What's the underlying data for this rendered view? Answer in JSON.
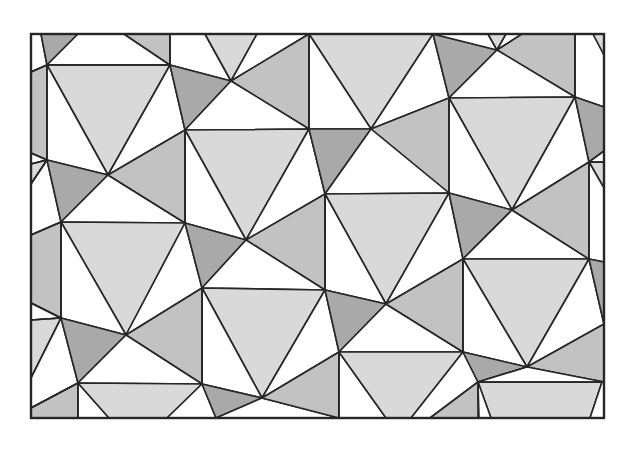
{
  "figure": {
    "title": "Periodic triangle-and-square tiling",
    "caption": "",
    "frame": {
      "x": 31,
      "y": 34,
      "width": 573,
      "height": 384
    },
    "colors": {
      "white": "#ffffff",
      "light": "#d9d9d9",
      "medium": "#c2c2c2",
      "dark": "#a9a9a9",
      "stroke": "#262626",
      "background": "#ffffff"
    },
    "polygons": [
      {
        "fill": "white",
        "points": "31,34 41,34 47,65 31,72"
      },
      {
        "fill": "dark",
        "points": "41,34 78,34 47,65"
      },
      {
        "fill": "white",
        "points": "78,34 124,34 170,65 47,65"
      },
      {
        "fill": "medium",
        "points": "124,34 170,34 170,65"
      },
      {
        "fill": "white",
        "points": "170,34 205,34 231,81 170,65"
      },
      {
        "fill": "light",
        "points": "205,34 257,34 231,81"
      },
      {
        "fill": "white",
        "points": "257,34 309,34 231,81"
      },
      {
        "fill": "medium",
        "points": "309,34 309,129 231,81"
      },
      {
        "fill": "light",
        "points": "309,34 433,34 371,129"
      },
      {
        "fill": "white",
        "points": "309,34 371,129 309,129"
      },
      {
        "fill": "white",
        "points": "433,34 449,98 371,129"
      },
      {
        "fill": "dark",
        "points": "433,34 497,50 449,98"
      },
      {
        "fill": "white",
        "points": "433,34 488,34 497,50"
      },
      {
        "fill": "light",
        "points": "488,34 506,34 497,50"
      },
      {
        "fill": "white",
        "points": "506,34 522,34 497,50"
      },
      {
        "fill": "medium",
        "points": "522,34 575,34 575,97 497,50"
      },
      {
        "fill": "white",
        "points": "497,50 575,97 449,98"
      },
      {
        "fill": "white",
        "points": "575,34 593,34 604,55 604,107 575,97"
      },
      {
        "fill": "light",
        "points": "593,34 604,34 604,55"
      },
      {
        "fill": "medium",
        "points": "31,72 47,65 47,160 31,153"
      },
      {
        "fill": "light",
        "points": "47,65 170,65 108,175"
      },
      {
        "fill": "white",
        "points": "47,65 108,175 47,160"
      },
      {
        "fill": "white",
        "points": "170,65 185,130 108,175"
      },
      {
        "fill": "dark",
        "points": "170,65 231,81 185,130"
      },
      {
        "fill": "white",
        "points": "231,81 309,129 185,130"
      },
      {
        "fill": "medium",
        "points": "449,98 449,193 371,129"
      },
      {
        "fill": "light",
        "points": "449,98 575,97 512,210"
      },
      {
        "fill": "white",
        "points": "449,98 512,210 449,193"
      },
      {
        "fill": "white",
        "points": "575,97 589,162 512,210"
      },
      {
        "fill": "dark",
        "points": "575,97 604,107 604,151 589,162"
      },
      {
        "fill": "white",
        "points": "31,153 47,160 31,164"
      },
      {
        "fill": "light",
        "points": "31,164 47,160 31,184"
      },
      {
        "fill": "white",
        "points": "31,184 47,160 61,222 31,235"
      },
      {
        "fill": "dark",
        "points": "47,160 108,175 61,222"
      },
      {
        "fill": "white",
        "points": "108,175 185,223 61,222"
      },
      {
        "fill": "light",
        "points": "185,130 309,129 246,240"
      },
      {
        "fill": "white",
        "points": "185,130 246,240 185,223"
      },
      {
        "fill": "medium",
        "points": "108,175 185,130 185,223"
      },
      {
        "fill": "white",
        "points": "309,129 325,194 246,240"
      },
      {
        "fill": "dark",
        "points": "309,129 371,129 325,194"
      },
      {
        "fill": "white",
        "points": "371,129 449,193 325,194"
      },
      {
        "fill": "light",
        "points": "325,194 449,193 386,304"
      },
      {
        "fill": "white",
        "points": "325,194 386,304 325,290"
      },
      {
        "fill": "medium",
        "points": "246,240 325,194 325,290"
      },
      {
        "fill": "white",
        "points": "449,193 463,259 386,304"
      },
      {
        "fill": "dark",
        "points": "449,193 512,210 463,259"
      },
      {
        "fill": "white",
        "points": "512,210 589,259 463,259"
      },
      {
        "fill": "medium",
        "points": "512,210 589,162 589,259"
      },
      {
        "fill": "light",
        "points": "589,162 604,162 604,188"
      },
      {
        "fill": "white",
        "points": "589,162 604,188 604,262 589,259"
      },
      {
        "fill": "white",
        "points": "589,162 604,151 604,162"
      },
      {
        "fill": "medium",
        "points": "31,235 61,222 61,318 31,303"
      },
      {
        "fill": "light",
        "points": "61,222 185,223 126,335"
      },
      {
        "fill": "white",
        "points": "61,222 126,335 61,318"
      },
      {
        "fill": "white",
        "points": "185,223 202,288 126,335"
      },
      {
        "fill": "dark",
        "points": "185,223 246,240 202,288"
      },
      {
        "fill": "white",
        "points": "246,240 325,290 202,288"
      },
      {
        "fill": "light",
        "points": "202,288 325,290 262,398"
      },
      {
        "fill": "white",
        "points": "202,288 262,398 202,384"
      },
      {
        "fill": "medium",
        "points": "126,335 202,288 202,384"
      },
      {
        "fill": "white",
        "points": "325,290 339,352 262,398"
      },
      {
        "fill": "dark",
        "points": "325,290 386,304 339,352"
      },
      {
        "fill": "white",
        "points": "386,304 463,352 339,352"
      },
      {
        "fill": "medium",
        "points": "386,304 463,259 463,352"
      },
      {
        "fill": "light",
        "points": "463,259 589,259 527,367"
      },
      {
        "fill": "white",
        "points": "463,259 527,367 463,352"
      },
      {
        "fill": "white",
        "points": "589,259 604,324 527,367"
      },
      {
        "fill": "dark",
        "points": "589,259 604,262 604,324"
      },
      {
        "fill": "white",
        "points": "31,303 61,318 31,320"
      },
      {
        "fill": "light",
        "points": "31,320 61,318 31,378"
      },
      {
        "fill": "white",
        "points": "31,378 61,318 78,383 31,408"
      },
      {
        "fill": "dark",
        "points": "61,318 126,335 78,383"
      },
      {
        "fill": "white",
        "points": "126,335 202,384 78,383"
      },
      {
        "fill": "medium",
        "points": "31,408 78,383 78,418 31,418"
      },
      {
        "fill": "white",
        "points": "78,383 109,418 78,418"
      },
      {
        "fill": "light",
        "points": "78,383 202,384 167,418 109,418"
      },
      {
        "fill": "white",
        "points": "202,384 216,418 167,418"
      },
      {
        "fill": "dark",
        "points": "202,384 262,398 216,418"
      },
      {
        "fill": "white",
        "points": "262,398 339,418 216,418"
      },
      {
        "fill": "medium",
        "points": "262,398 339,352 339,418"
      },
      {
        "fill": "white",
        "points": "339,352 386,418 339,418"
      },
      {
        "fill": "light",
        "points": "339,352 463,352 411,418 386,418"
      },
      {
        "fill": "white",
        "points": "463,352 479,416 479,418 411,418 431,418"
      },
      {
        "fill": "white",
        "points": "463,352 478,382 430,418 411,418"
      },
      {
        "fill": "medium",
        "points": "478,382 479,418 430,418"
      },
      {
        "fill": "dark",
        "points": "463,352 527,367 478,382"
      },
      {
        "fill": "white",
        "points": "527,367 602,418 586,418 478,382"
      },
      {
        "fill": "light",
        "points": "478,382 602,382 590,418 491,418"
      },
      {
        "fill": "white",
        "points": "478,382 491,418 479,418"
      },
      {
        "fill": "medium",
        "points": "527,367 604,324 604,382"
      },
      {
        "fill": "white",
        "points": "527,367 604,382 478,382"
      },
      {
        "fill": "white",
        "points": "602,382 604,382 604,418 590,418"
      }
    ],
    "lines": [
      "31,72 47,65",
      "47,65 47,160",
      "47,65 170,65",
      "31,153 47,160",
      "31,164 47,160",
      "31,184 47,160",
      "31,235 61,222",
      "61,222 61,318",
      "31,303 61,318",
      "31,320 61,318",
      "31,378 61,318",
      "31,408 78,383",
      "78,383 78,418",
      "478,382 604,382",
      "478,382 478,418",
      "575,34 575,97",
      "589,162 589,259",
      "589,162 604,162",
      "309,34 309,129",
      "449,98 449,193",
      "463,259 463,352",
      "185,130 185,223",
      "202,288 202,384",
      "325,194 325,290",
      "339,352 339,418",
      "170,34 170,65"
    ]
  }
}
